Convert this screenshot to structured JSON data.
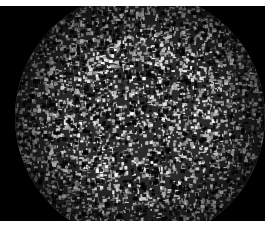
{
  "image": {
    "description": "Grayscale micrograph: circular field of view filled with a dense bright speckle pattern on a black background",
    "background_color": "#000000",
    "border_color": "#ffffff",
    "speckle_light": "#e8e8e8",
    "speckle_dark": "#2a2a2a"
  }
}
